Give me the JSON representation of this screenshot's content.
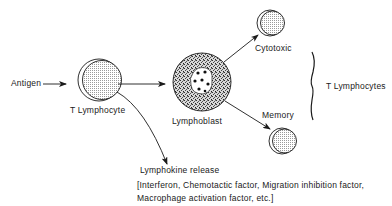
{
  "diagram": {
    "nodes": {
      "antigen": {
        "label": "Antigen"
      },
      "t_lymphocyte": {
        "label": "T Lymphocyte"
      },
      "lymphoblast": {
        "label": "Lymphoblast"
      },
      "cytotoxic": {
        "label": "Cytotoxic"
      },
      "memory": {
        "label": "Memory"
      }
    },
    "group_label": "T Lymphocytes",
    "lymphokine": {
      "title": "Lymphokine release",
      "line1": "[Interferon, Chemotactic factor, Migration inhibition factor,",
      "line2": "Macrophage activation factor, etc.]"
    },
    "edges": [
      {
        "from": "antigen",
        "to": "t_lymphocyte"
      },
      {
        "from": "t_lymphocyte",
        "to": "lymphoblast"
      },
      {
        "from": "t_lymphocyte",
        "to": "lymphokine"
      },
      {
        "from": "lymphoblast",
        "to": "cytotoxic"
      },
      {
        "from": "lymphoblast",
        "to": "memory"
      }
    ]
  }
}
